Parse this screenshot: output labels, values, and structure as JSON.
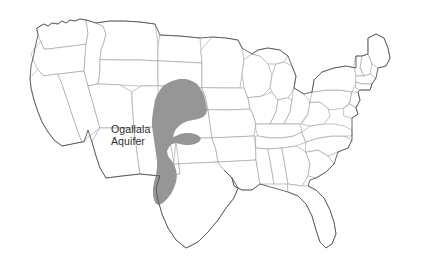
{
  "figure": {
    "type": "thematic-map",
    "region_depicted": "Contiguous United States",
    "background_color": "#ffffff"
  },
  "map": {
    "name": "united-states-map",
    "state_boundary_color": "#9a9a9a",
    "national_outline_color": "#4a4a4a",
    "land_fill_color": "#ffffff"
  },
  "aquifer": {
    "label_line_1": "Ogallala",
    "label_line_2": "Aquifer",
    "fill_color": "#969696",
    "label_color": "#2b2b2b",
    "extent_states": [
      "South Dakota",
      "Nebraska",
      "Wyoming",
      "Colorado",
      "Kansas",
      "Oklahoma",
      "New Mexico",
      "Texas"
    ]
  }
}
